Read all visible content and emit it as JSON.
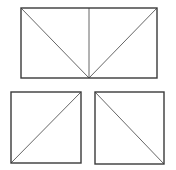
{
  "diagram": {
    "colors": {
      "background": "#ffffff",
      "stroke": "#3a3a3a",
      "inner_stroke": "#555555"
    },
    "shapes": [
      {
        "name": "top-rectangle",
        "rect": {
          "x": 21,
          "y": 8,
          "w": 136,
          "h": 70
        },
        "lines": [
          {
            "name": "vertical-midline",
            "x1": 89,
            "y1": 8,
            "x2": 89,
            "y2": 78
          },
          {
            "name": "left-diagonal",
            "x1": 21,
            "y1": 8,
            "x2": 89,
            "y2": 78
          },
          {
            "name": "right-diagonal",
            "x1": 157,
            "y1": 8,
            "x2": 89,
            "y2": 78
          }
        ]
      },
      {
        "name": "bottom-left-square",
        "rect": {
          "x": 11,
          "y": 92,
          "w": 70,
          "h": 71
        },
        "lines": [
          {
            "name": "ascending-diagonal",
            "x1": 11,
            "y1": 163,
            "x2": 81,
            "y2": 92
          }
        ]
      },
      {
        "name": "bottom-right-square",
        "rect": {
          "x": 95,
          "y": 92,
          "w": 69,
          "h": 72
        },
        "lines": [
          {
            "name": "descending-diagonal",
            "x1": 95,
            "y1": 92,
            "x2": 164,
            "y2": 164
          }
        ]
      }
    ]
  }
}
